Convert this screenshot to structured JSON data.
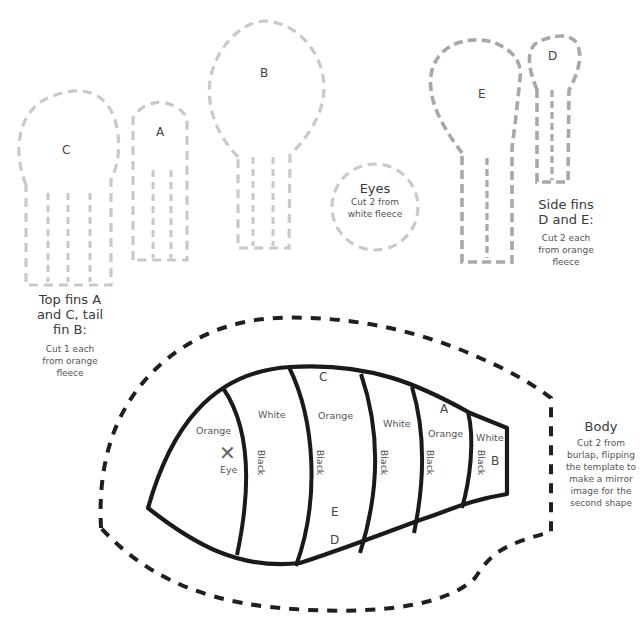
{
  "pieces": {
    "fin_c": {
      "label": "C"
    },
    "fin_a": {
      "label": "A"
    },
    "fin_b": {
      "label": "B"
    },
    "fin_e": {
      "label": "E"
    },
    "fin_d": {
      "label": "D"
    },
    "eyes": {
      "title": "Eyes",
      "instructions": "Cut 2 from\nwhite fleece",
      "instructions_line1": "Cut 2 from",
      "instructions_line2": "white fleece"
    }
  },
  "captions": {
    "top_fins": {
      "title_line1": "Top fins A",
      "title_line2": "and C, tail",
      "title_line3": "fin B:",
      "instr_line1": "Cut 1 each",
      "instr_line2": "from orange",
      "instr_line3": "fleece"
    },
    "side_fins": {
      "title_line1": "Side fins",
      "title_line2": "D and E:",
      "instr_line1": "Cut 2 each",
      "instr_line2": "from orange",
      "instr_line3": "fleece"
    },
    "body": {
      "title": "Body",
      "instr_line1": "Cut 2 from",
      "instr_line2": "burlap, flipping",
      "instr_line3": "the template to",
      "instr_line4": "make a mirror",
      "instr_line5": "image for the",
      "instr_line6": "second shape"
    }
  },
  "body_zones": {
    "stripes": [
      {
        "color_label": "Orange",
        "stripe_label": "Black"
      },
      {
        "color_label": "White",
        "stripe_label": "Black"
      },
      {
        "color_label": "Orange",
        "stripe_label": "Black"
      },
      {
        "color_label": "White",
        "stripe_label": "Black"
      },
      {
        "color_label": "Orange",
        "stripe_label": "Black"
      },
      {
        "color_label": "White",
        "stripe_label": "Black"
      }
    ],
    "eye_marker": "✕",
    "eye_label": "Eye",
    "placement_labels": {
      "c": "C",
      "a": "A",
      "b": "B",
      "e": "E",
      "d": "D"
    }
  },
  "colors": {
    "light_dash": "#c9c9c9",
    "medium_dash": "#a8a8a8",
    "dark_dash": "#1f1f1f",
    "outline": "#1a1a1a"
  }
}
